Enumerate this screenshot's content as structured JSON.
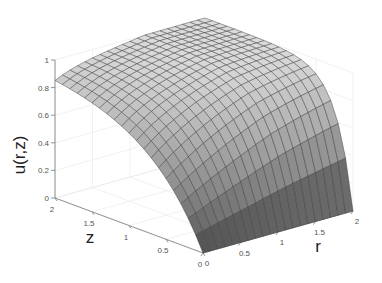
{
  "chart_data": {
    "type": "surface",
    "title": "",
    "xlabel": "r",
    "ylabel": "z",
    "zlabel": "u(r,z)",
    "xlim": [
      0,
      2
    ],
    "ylim": [
      0,
      2
    ],
    "zlim": [
      0,
      1
    ],
    "x_ticks": [
      "0",
      "0.5",
      "1",
      "1.5",
      "2"
    ],
    "y_ticks": [
      "0",
      "0.5",
      "1",
      "1.5",
      "2"
    ],
    "z_ticks": [
      "0",
      "0.2",
      "0.4",
      "0.6",
      "0.8",
      "1"
    ],
    "grid": true,
    "mesh": {
      "nr": 20,
      "nz": 20
    },
    "colormap": "gray",
    "sample_values": {
      "r0_z2": 0.92,
      "r2_z2": 1.0,
      "r0_z0": 0.0,
      "r2_z0": 0.0
    }
  },
  "labels": {
    "u_axis": "u(r,z)",
    "z_axis": "z",
    "r_axis": "r"
  }
}
